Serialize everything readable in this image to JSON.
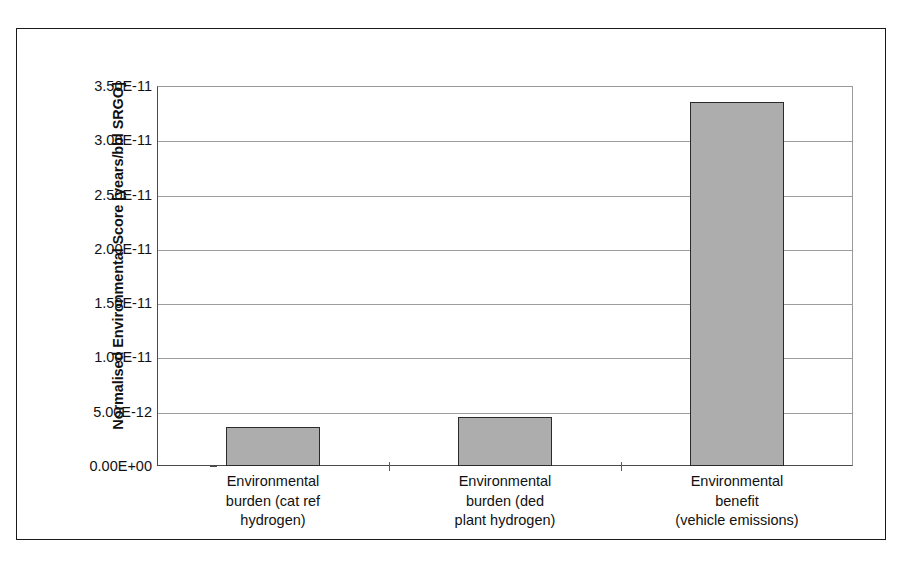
{
  "chart_data": {
    "type": "bar",
    "title": "",
    "xlabel": "",
    "ylabel": "Normalised Environmental Score [years/bbl SRGO]",
    "categories": [
      "Environmental burden (cat ref hydrogen)",
      "Environmental burden (ded plant hydrogen)",
      "Environmental benefit (vehicle emissions)"
    ],
    "category_lines": [
      [
        "Environmental",
        "burden (cat ref",
        "hydrogen)"
      ],
      [
        "Environmental",
        "burden (ded",
        "plant hydrogen)"
      ],
      [
        "Environmental",
        "benefit",
        "(vehicle emissions)"
      ]
    ],
    "values": [
      3.6e-12,
      4.5e-12,
      3.35e-11
    ],
    "value_labels": [
      "3.60E-12",
      "4.50E-12",
      "3.35E-11"
    ],
    "ylim": [
      0,
      3.5e-11
    ],
    "ytick_values": [
      0,
      5e-12,
      1e-11,
      1.5e-11,
      2e-11,
      2.5e-11,
      3e-11,
      3.5e-11
    ],
    "ytick_labels": [
      "0.00E+00",
      "5.00E-12",
      "1.00E-11",
      "1.50E-11",
      "2.00E-11",
      "2.50E-11",
      "3.00E-11",
      "3.50E-11"
    ],
    "grid": true,
    "grid_axis": "y",
    "legend": false,
    "legend_position": "none",
    "bar_fill_color": "#adadad",
    "bar_edge_color": "#2b2b2b",
    "gridline_color": "#9d9d9d",
    "axis_color": "#4a4a4a",
    "text_color": "#111111",
    "background_color": "#ffffff"
  },
  "figure": {
    "frame_visible": true,
    "frame_color": "#1a1a1a"
  }
}
